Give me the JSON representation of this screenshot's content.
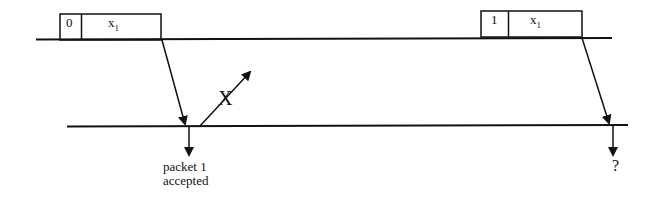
{
  "diagram": {
    "type": "protocol-timing-diagram",
    "colors": {
      "line": "#111111",
      "background": "#ffffff"
    },
    "sender_timeline": {
      "y": 39,
      "x_start": 36,
      "x_end": 612
    },
    "receiver_timeline": {
      "y": 126,
      "x_start": 67,
      "x_end": 628
    },
    "packets": [
      {
        "seq": "0",
        "payload": "x",
        "payload_sub": "1"
      },
      {
        "seq": "1",
        "payload": "x",
        "payload_sub": "1"
      }
    ],
    "lost_marker": "X",
    "labels": {
      "accepted_line1": "packet 1",
      "accepted_line2": "accepted",
      "unknown": "?"
    }
  }
}
